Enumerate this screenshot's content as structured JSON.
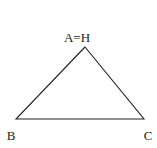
{
  "diagram": {
    "type": "triangle",
    "vertices": [
      {
        "id": "A",
        "label": "A=H",
        "x": 85,
        "y": 47
      },
      {
        "id": "B",
        "label": "B",
        "x": 16,
        "y": 119
      },
      {
        "id": "C",
        "label": "C",
        "x": 144,
        "y": 119
      }
    ],
    "stroke_color": "#222222"
  }
}
